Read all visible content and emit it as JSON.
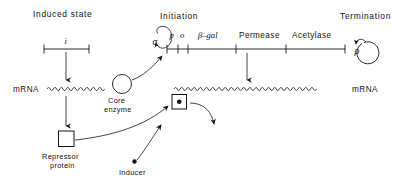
{
  "figure": {
    "title_left": "Induced state",
    "title_initiation": "Initiation",
    "title_termination": "Termination",
    "background": "#ffffff",
    "ink": "#141414"
  },
  "regulator": {
    "gene_label": "i",
    "mrna_label": "mRNA",
    "product_label_line1": "Repressor",
    "product_label_line2": "protein"
  },
  "polymerase": {
    "sigma_label": "σ",
    "core_label_line1": "Core",
    "core_label_line2": "enzyme"
  },
  "operon": {
    "segments": [
      {
        "label": "p"
      },
      {
        "label": "o"
      },
      {
        "label": "β–gal"
      },
      {
        "label": "Permease"
      },
      {
        "label": "Acetylase"
      }
    ],
    "mrna_label": "mRNA",
    "rho_label": "ρ"
  },
  "inducer": {
    "label": "Inducer"
  }
}
